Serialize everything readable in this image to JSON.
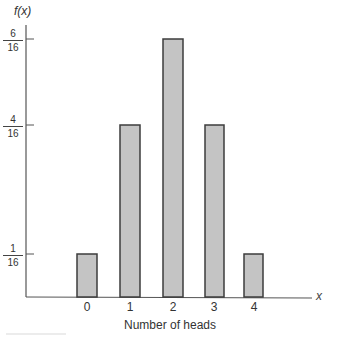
{
  "chart_data": {
    "type": "bar",
    "title": "",
    "xlabel": "Number of heads",
    "ylabel": "f(x)",
    "x_axis_variable": "x",
    "categories": [
      "0",
      "1",
      "2",
      "3",
      "4"
    ],
    "values": [
      0.0625,
      0.25,
      0.375,
      0.25,
      0.0625
    ],
    "values_fraction": [
      "1/16",
      "4/16",
      "6/16",
      "4/16",
      "1/16"
    ],
    "y_ticks": [
      {
        "num": "1",
        "den": "16",
        "value": 0.0625
      },
      {
        "num": "4",
        "den": "16",
        "value": 0.25
      },
      {
        "num": "6",
        "den": "16",
        "value": 0.375
      }
    ],
    "ylim": [
      0,
      0.4
    ],
    "grid": false,
    "legend": null,
    "colors": {
      "bar_fill": "#c4c4c4",
      "bar_edge": "#3c3c3c",
      "axis": "#555555"
    }
  }
}
